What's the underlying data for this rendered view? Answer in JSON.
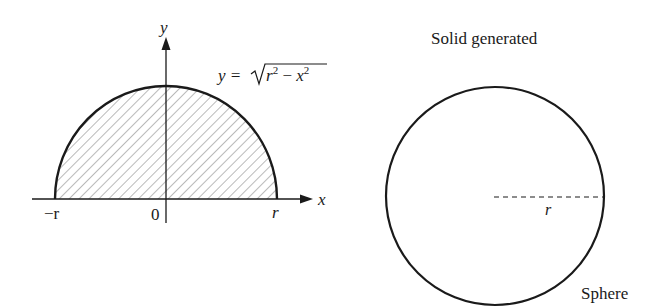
{
  "left_figure": {
    "x_axis_label": "x",
    "y_axis_label": "y",
    "equation_lhs": "y = ",
    "equation_radicand_r": "r",
    "equation_radicand_sup1": "2",
    "equation_radicand_minus": " − ",
    "equation_radicand_x": "x",
    "equation_radicand_sup2": "2",
    "tick_left": "−r",
    "tick_origin": "0",
    "tick_right": "r",
    "region": "upper semicircle, hatched"
  },
  "right_figure": {
    "title": "Solid generated",
    "radius_label": "r",
    "caption": "Sphere"
  },
  "colors": {
    "stroke": "#1a1a1a",
    "hatch": "#555555",
    "background": "#ffffff"
  }
}
